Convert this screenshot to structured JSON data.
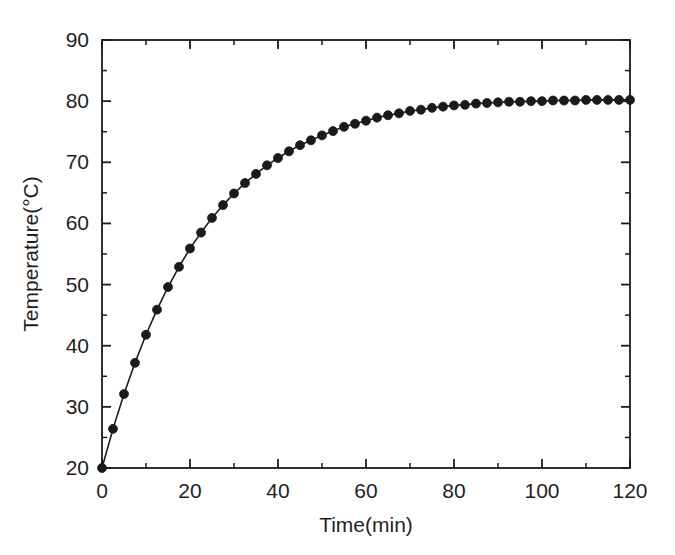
{
  "figure": {
    "background_color": "#ffffff",
    "ink_color": "#1a1a1a"
  },
  "chart_data": {
    "type": "line",
    "title": "",
    "subtitle": "",
    "xlabel": "Time(min)",
    "ylabel": "Temperature(°C)",
    "xlim": [
      0,
      120
    ],
    "ylim": [
      20,
      90
    ],
    "xticks": [
      0,
      20,
      40,
      60,
      80,
      100,
      120
    ],
    "xticklabels": [
      "0",
      "20",
      "40",
      "60",
      "80",
      "100",
      "120"
    ],
    "yticks": [
      20,
      30,
      40,
      50,
      60,
      70,
      80,
      90
    ],
    "yticklabels": [
      "20",
      "30",
      "40",
      "50",
      "60",
      "70",
      "80",
      "90"
    ],
    "x_minor_tick_interval": 10,
    "y_minor_tick_interval": 5,
    "grid": false,
    "legend": null,
    "legend_position": "none",
    "box_frame": true,
    "tick_direction": "in",
    "marker": "filled-circle",
    "marker_size_px": 9,
    "line_color": "#1a1a1a",
    "marker_color": "#1a1a1a",
    "line_width_px": 1.6,
    "annotations": [],
    "model_note": "T(t) = 80 - 60*exp(-t/22)",
    "x": [
      0,
      2.5,
      5,
      7.5,
      10,
      12.5,
      15,
      17.5,
      20,
      22.5,
      25,
      27.5,
      30,
      32.5,
      35,
      37.5,
      40,
      42.5,
      45,
      47.5,
      50,
      52.5,
      55,
      57.5,
      60,
      62.5,
      65,
      67.5,
      70,
      72.5,
      75,
      77.5,
      80,
      82.5,
      85,
      87.5,
      90,
      92.5,
      95,
      97.5,
      100,
      102.5,
      105,
      107.5,
      110,
      112.5,
      115,
      117.5,
      120
    ],
    "y": [
      20.0,
      26.4,
      32.1,
      37.2,
      41.8,
      45.9,
      49.6,
      52.9,
      55.9,
      58.5,
      60.9,
      63.0,
      64.9,
      66.6,
      68.1,
      69.5,
      70.7,
      71.8,
      72.8,
      73.6,
      74.4,
      75.1,
      75.8,
      76.3,
      76.8,
      77.3,
      77.7,
      78.0,
      78.4,
      78.6,
      78.9,
      79.1,
      79.3,
      79.4,
      79.6,
      79.7,
      79.8,
      79.9,
      79.9,
      80.0,
      80.0,
      80.1,
      80.1,
      80.1,
      80.2,
      80.2,
      80.2,
      80.2,
      80.2
    ],
    "series": [
      {
        "name": "Temperature",
        "values": [
          20.0,
          26.4,
          32.1,
          37.2,
          41.8,
          45.9,
          49.6,
          52.9,
          55.9,
          58.5,
          60.9,
          63.0,
          64.9,
          66.6,
          68.1,
          69.5,
          70.7,
          71.8,
          72.8,
          73.6,
          74.4,
          75.1,
          75.8,
          76.3,
          76.8,
          77.3,
          77.7,
          78.0,
          78.4,
          78.6,
          78.9,
          79.1,
          79.3,
          79.4,
          79.6,
          79.7,
          79.8,
          79.9,
          79.9,
          80.0,
          80.0,
          80.1,
          80.1,
          80.1,
          80.2,
          80.2,
          80.2,
          80.2,
          80.2
        ]
      }
    ]
  }
}
